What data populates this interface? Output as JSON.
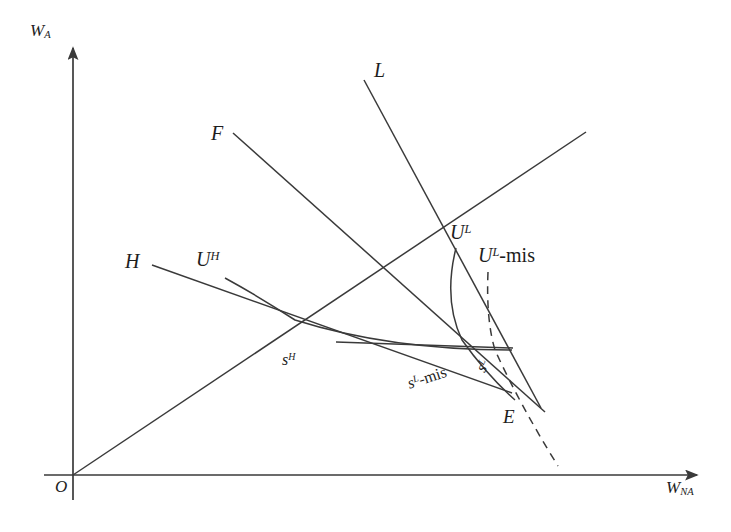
{
  "figure": {
    "type": "economics-signaling-diagram",
    "background_color": "#ffffff",
    "line_color": "#3a3a3a",
    "text_color": "#1d1d1d",
    "width": 731,
    "height": 532
  },
  "axes": {
    "y_label": "W",
    "y_label_sub": "A",
    "x_label": "W",
    "x_label_sub": "NA",
    "origin_label": "O",
    "origin_px": [
      73,
      475
    ],
    "y_axis_top_px": [
      73,
      45
    ],
    "x_axis_right_px": [
      700,
      475
    ]
  },
  "curves": [
    {
      "name": "F",
      "label": "F",
      "kind": "line",
      "style": "solid",
      "label_px": [
        211,
        123
      ],
      "from_px": [
        233,
        133
      ],
      "to_px": [
        545,
        412
      ]
    },
    {
      "name": "L",
      "label": "L",
      "kind": "line",
      "style": "solid",
      "label_px": [
        374,
        60
      ],
      "from_px": [
        364,
        80
      ],
      "to_px": [
        541,
        408
      ]
    },
    {
      "name": "H",
      "label": "H",
      "kind": "line",
      "style": "solid",
      "label_px": [
        125,
        251
      ],
      "from_px": [
        152,
        265
      ],
      "to_px": [
        512,
        393
      ]
    },
    {
      "name": "forty-five-ray",
      "label": "",
      "kind": "ray",
      "style": "solid",
      "from_px": [
        73,
        475
      ],
      "to_px": [
        586,
        132
      ]
    },
    {
      "name": "U-H",
      "label": "U",
      "label_sup": "H",
      "kind": "indifference-curve",
      "style": "solid",
      "label_px": [
        196,
        249
      ],
      "from_px": [
        225,
        278
      ],
      "to_px": [
        512,
        350
      ]
    },
    {
      "name": "U-L",
      "label": "U",
      "label_sup": "L",
      "kind": "indifference-curve",
      "style": "solid",
      "label_px": [
        450,
        222
      ],
      "from_px": [
        456,
        248
      ],
      "to_px": [
        515,
        400
      ]
    },
    {
      "name": "U-L-mis",
      "label": "U",
      "label_sup": "L",
      "label_suffix": "-mis",
      "kind": "indifference-curve",
      "style": "dashed",
      "label_px": [
        478,
        245
      ],
      "from_px": [
        488,
        272
      ],
      "to_px": [
        558,
        466
      ]
    },
    {
      "name": "horizontal-segment",
      "label": "",
      "kind": "line",
      "style": "solid",
      "from_px": [
        336,
        342
      ],
      "to_px": [
        513,
        348
      ]
    }
  ],
  "points": [
    {
      "name": "s-H",
      "label": "s",
      "label_sup": "H",
      "at_px": [
        295,
        320
      ],
      "label_px": [
        282,
        352
      ]
    },
    {
      "name": "s-L",
      "label": "s",
      "label_sup": "L",
      "at_px": [
        490,
        348
      ],
      "label_px": [
        480,
        363
      ],
      "rotate_deg": -62
    },
    {
      "name": "s-L-mis",
      "label": "s",
      "label_sup": "L",
      "label_suffix": "-mis",
      "at_px": [
        455,
        340
      ],
      "label_px": [
        408,
        376
      ],
      "rotate_deg": -18
    },
    {
      "name": "E",
      "label": "E",
      "at_px": [
        508,
        398
      ],
      "label_px": [
        503,
        407
      ]
    }
  ]
}
